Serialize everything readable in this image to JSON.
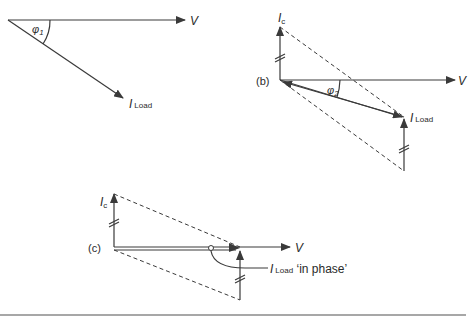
{
  "diagram": {
    "type": "phasor diagrams",
    "part_a": {
      "label": "",
      "voltage_label": "V",
      "current_label": "I",
      "current_subscript": "Load",
      "angle_label": "φ",
      "angle_subscript": "1"
    },
    "part_b": {
      "label": "(b)",
      "voltage_label": "V",
      "capacitor_current_label": "I",
      "capacitor_current_subscript": "c",
      "current_label": "I",
      "current_subscript": "Load",
      "angle_label": "φ",
      "angle_subscript": "2"
    },
    "part_c": {
      "label": "(c)",
      "voltage_label": "V",
      "capacitor_current_label": "I",
      "capacitor_current_subscript": "c",
      "current_label": "I",
      "current_subscript": "Load",
      "annotation_suffix": " ‘in phase’"
    }
  },
  "colors": {
    "line": "#3a3a3a",
    "text": "#2a2a2a",
    "background": "#ffffff",
    "rule": "#8a8a8a"
  }
}
